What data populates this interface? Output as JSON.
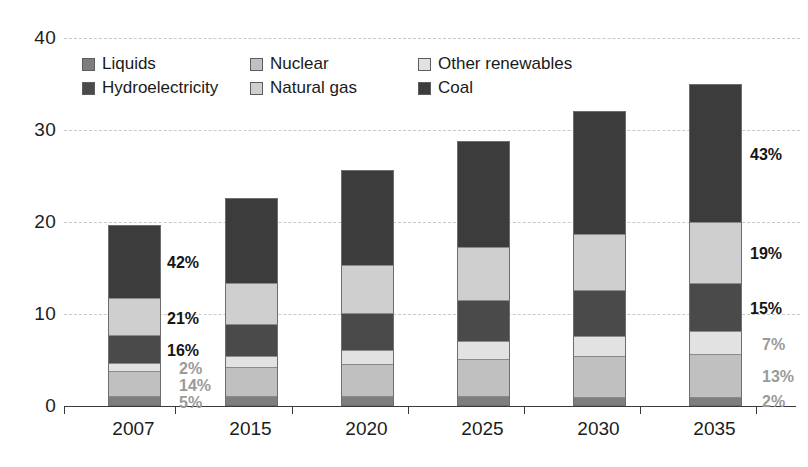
{
  "chart_data": {
    "type": "bar",
    "title": "",
    "subtitle": "",
    "xlabel": "",
    "ylabel": "",
    "stacked": true,
    "grid": true,
    "legend_position": "top-left",
    "categories": [
      "2007",
      "2015",
      "2020",
      "2025",
      "2030",
      "2035"
    ],
    "yticks": [
      0,
      10,
      20,
      30,
      40
    ],
    "ylim": [
      0,
      40
    ],
    "totals": [
      19.0,
      21.7,
      24.8,
      27.9,
      31.2,
      34.8
    ],
    "stack_order_bottom_to_top": [
      "Liquids",
      "Nuclear",
      "Other renewables",
      "Hydroelectricity",
      "Natural gas",
      "Coal"
    ],
    "series": [
      {
        "name": "Liquids",
        "color": "#7e7e7e",
        "values": [
          0.9,
          0.9,
          0.9,
          0.9,
          0.8,
          0.8
        ]
      },
      {
        "name": "Nuclear",
        "color": "#c0c0c0",
        "values": [
          2.7,
          3.1,
          3.5,
          4.0,
          4.4,
          4.6
        ]
      },
      {
        "name": "Other renewables",
        "color": "#e2e2e2",
        "values": [
          0.9,
          1.2,
          1.5,
          1.9,
          2.2,
          2.5
        ]
      },
      {
        "name": "Hydroelectricity",
        "color": "#4a4a4a",
        "values": [
          3.0,
          3.5,
          4.0,
          4.5,
          5.0,
          5.3
        ]
      },
      {
        "name": "Natural gas",
        "color": "#cfcfcf",
        "values": [
          4.0,
          4.5,
          5.2,
          5.8,
          6.1,
          6.6
        ]
      },
      {
        "name": "Coal",
        "color": "#3c3c3c",
        "values": [
          8.0,
          9.2,
          10.3,
          11.5,
          13.4,
          15.0
        ]
      }
    ],
    "percent_labels": {
      "2007": [
        {
          "series": "Coal",
          "text": "42%",
          "emphasis": "dark"
        },
        {
          "series": "Natural gas",
          "text": "21%",
          "emphasis": "dark"
        },
        {
          "series": "Hydroelectricity",
          "text": "16%",
          "emphasis": "dark"
        },
        {
          "series": "Other renewables",
          "text": "2%",
          "emphasis": "light"
        },
        {
          "series": "Nuclear",
          "text": "14%",
          "emphasis": "light"
        },
        {
          "series": "Liquids",
          "text": "5%",
          "emphasis": "light"
        }
      ],
      "2035": [
        {
          "series": "Coal",
          "text": "43%",
          "emphasis": "dark"
        },
        {
          "series": "Natural gas",
          "text": "19%",
          "emphasis": "dark"
        },
        {
          "series": "Hydroelectricity",
          "text": "15%",
          "emphasis": "dark"
        },
        {
          "series": "Other renewables",
          "text": "7%",
          "emphasis": "light"
        },
        {
          "series": "Nuclear",
          "text": "13%",
          "emphasis": "light"
        },
        {
          "series": "Liquids",
          "text": "2%",
          "emphasis": "light"
        }
      ]
    }
  },
  "legend": {
    "items": [
      {
        "label": "Liquids",
        "color": "#7e7e7e"
      },
      {
        "label": "Nuclear",
        "color": "#c0c0c0"
      },
      {
        "label": "Other renewables",
        "color": "#e2e2e2"
      },
      {
        "label": "Hydroelectricity",
        "color": "#4a4a4a"
      },
      {
        "label": "Natural gas",
        "color": "#cfcfcf"
      },
      {
        "label": "Coal",
        "color": "#3c3c3c"
      }
    ]
  },
  "axes": {
    "y_tick_labels": [
      "0",
      "10",
      "20",
      "30",
      "40"
    ],
    "x_tick_labels": [
      "2007",
      "2015",
      "2020",
      "2025",
      "2030",
      "2035"
    ]
  }
}
